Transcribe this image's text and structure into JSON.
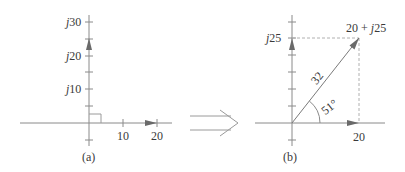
{
  "panel_a": {
    "caption": "(a)",
    "y_ticks": [
      {
        "prefix": "j",
        "value": "30"
      },
      {
        "prefix": "j",
        "value": "20"
      },
      {
        "prefix": "j",
        "value": "10"
      }
    ],
    "x_ticks": [
      "10",
      "20"
    ]
  },
  "transform_arrow": "double-arrow",
  "panel_b": {
    "caption": "(b)",
    "y_label_prefix": "j",
    "y_label_value": "25",
    "x_label": "20",
    "point_label_real": "20 + ",
    "point_label_prefix": "j",
    "point_label_imag": "25",
    "magnitude": "32",
    "angle": "51°"
  },
  "colors": {
    "axis": "#8a8a8a",
    "arrow": "#707070",
    "dashed": "#b0b0b0",
    "text": "#3a3a3a"
  }
}
